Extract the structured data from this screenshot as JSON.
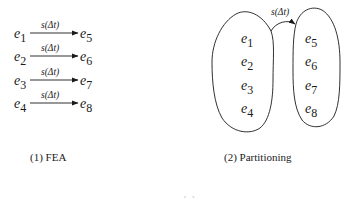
{
  "panel_fea": {
    "caption": "(1) FEA",
    "edge_label": "s(Δt)",
    "rows": [
      {
        "src": "e",
        "src_sub": "1",
        "dst": "e",
        "dst_sub": "5",
        "label": "s(Δt)"
      },
      {
        "src": "e",
        "src_sub": "2",
        "dst": "e",
        "dst_sub": "6",
        "label": "s(Δt)"
      },
      {
        "src": "e",
        "src_sub": "3",
        "dst": "e",
        "dst_sub": "7",
        "label": "s(Δt)"
      },
      {
        "src": "e",
        "src_sub": "4",
        "dst": "e",
        "dst_sub": "8",
        "label": "s(Δt)"
      }
    ]
  },
  "panel_partitioning": {
    "caption": "(2) Partitioning",
    "edge_label": "s(Δt)",
    "left_partition": [
      {
        "name": "e",
        "sub": "1"
      },
      {
        "name": "e",
        "sub": "2"
      },
      {
        "name": "e",
        "sub": "3"
      },
      {
        "name": "e",
        "sub": "4"
      }
    ],
    "right_partition": [
      {
        "name": "e",
        "sub": "5"
      },
      {
        "name": "e",
        "sub": "6"
      },
      {
        "name": "e",
        "sub": "7"
      },
      {
        "name": "e",
        "sub": "8"
      }
    ]
  },
  "bottom_caption": "(a)",
  "colors": {
    "stroke": "#1a1a1a",
    "background": "#ffffff"
  }
}
